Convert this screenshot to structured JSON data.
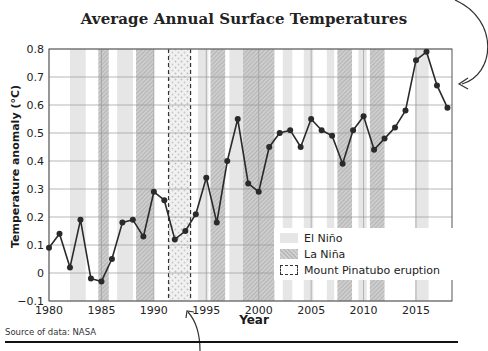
{
  "chart_data": {
    "type": "line",
    "title": "Average Annual Surface Temperatures",
    "xlabel": "Year",
    "ylabel": "Temperature anomaly (°C)",
    "source": "Source of data: NASA",
    "xlim": [
      1980,
      2018
    ],
    "ylim": [
      -0.1,
      0.8
    ],
    "x_ticks": [
      1980,
      1985,
      1990,
      1995,
      2000,
      2005,
      2010,
      2015
    ],
    "y_ticks": [
      -0.1,
      0,
      0.1,
      0.2,
      0.3,
      0.4,
      0.5,
      0.6,
      0.7,
      0.8
    ],
    "y_tick_labels": [
      "−0.1",
      "0",
      "0.1",
      "0.2",
      "0.3",
      "0.4",
      "0.5",
      "0.6",
      "0.7",
      "0.8"
    ],
    "grid": true,
    "legend_position": "lower right",
    "series": [
      {
        "name": "Temperature anomaly",
        "x": [
          1980,
          1981,
          1982,
          1983,
          1984,
          1985,
          1986,
          1987,
          1988,
          1989,
          1990,
          1991,
          1992,
          1993,
          1994,
          1995,
          1996,
          1997,
          1998,
          1999,
          2000,
          2001,
          2002,
          2003,
          2004,
          2005,
          2006,
          2007,
          2008,
          2009,
          2010,
          2011,
          2012,
          2013,
          2014,
          2015,
          2016,
          2017,
          2018
        ],
        "values": [
          0.09,
          0.14,
          0.02,
          0.19,
          -0.02,
          -0.03,
          0.05,
          0.18,
          0.19,
          0.13,
          0.29,
          0.26,
          0.12,
          0.15,
          0.21,
          0.34,
          0.18,
          0.4,
          0.55,
          0.32,
          0.29,
          0.45,
          0.5,
          0.51,
          0.45,
          0.55,
          0.51,
          0.49,
          0.39,
          0.51,
          0.56,
          0.44,
          0.48,
          0.52,
          0.58,
          0.76,
          0.79,
          0.67,
          0.59
        ]
      }
    ],
    "bands": {
      "el_nino": [
        [
          1982,
          1983.5
        ],
        [
          1986.5,
          1988
        ],
        [
          1994.2,
          1995.2
        ],
        [
          1997.2,
          1998.5
        ],
        [
          2002.3,
          2003.2
        ],
        [
          2004.3,
          2005.2
        ],
        [
          2006.5,
          2007.2
        ],
        [
          2009.5,
          2010.3
        ],
        [
          2014.9,
          2016.2
        ]
      ],
      "la_nina": [
        [
          1984.7,
          1985.7
        ],
        [
          1988.3,
          1990
        ],
        [
          1995.4,
          1996.8
        ],
        [
          1998.5,
          2001.5
        ],
        [
          2007.5,
          2008.9
        ],
        [
          2010.6,
          2012
        ]
      ],
      "pinatubo": [
        1991.4,
        1993.5
      ]
    },
    "legend": [
      "El Niño",
      "La Niña",
      "Mount Pinatubo eruption"
    ]
  },
  "legend": {
    "el_nino": "El Niño",
    "la_nina": "La Niña",
    "pinatubo": "Mount Pinatubo eruption"
  }
}
